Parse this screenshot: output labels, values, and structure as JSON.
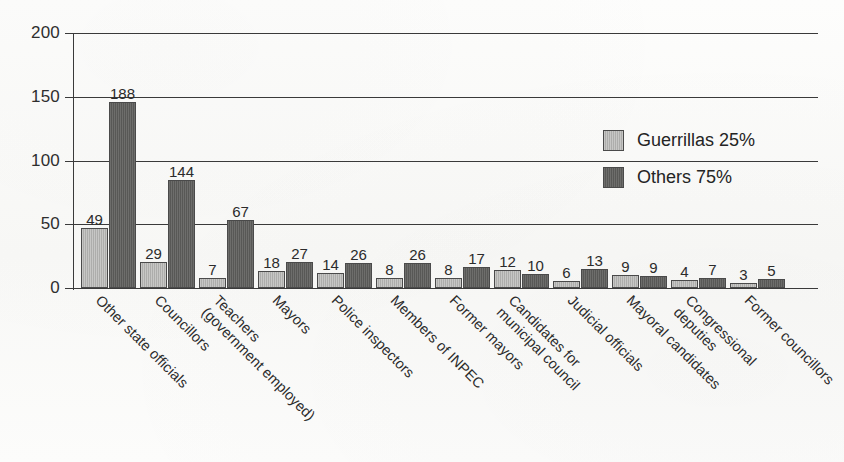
{
  "chart_data": {
    "type": "bar",
    "title": "",
    "subtitle": "",
    "xlabel": "",
    "ylabel": "",
    "ylim": [
      0,
      200
    ],
    "yticks": [
      0,
      50,
      100,
      150,
      200
    ],
    "ytick_labels": [
      "0",
      "50",
      "100",
      "150",
      "200"
    ],
    "grid": true,
    "grid_axis": "y",
    "legend_position": "inside-upper-right",
    "categories": [
      "Other state officials",
      "Councillors",
      "Teachers (government employed)",
      "Mayors",
      "Police inspectors",
      "Members of INPEC",
      "Former mayors",
      "Candidates for municipal council",
      "Judicial officials",
      "Mayoral candidates",
      "Congressional deputies",
      "Former councillors"
    ],
    "category_lines": [
      [
        "Other state officials"
      ],
      [
        "Councillors"
      ],
      [
        "Teachers",
        "(government employed)"
      ],
      [
        "Mayors"
      ],
      [
        "Police inspectors"
      ],
      [
        "Members of INPEC"
      ],
      [
        "Former mayors"
      ],
      [
        "Candidates for",
        "municipal council"
      ],
      [
        "Judicial officials"
      ],
      [
        "Mayoral candidates"
      ],
      [
        "Congressional",
        "deputies"
      ],
      [
        "Former councillors"
      ]
    ],
    "series": [
      {
        "name": "Guerrillas 25%",
        "color": "#b4b4b2",
        "values": [
          49,
          29,
          7,
          18,
          14,
          8,
          8,
          12,
          6,
          9,
          4,
          3
        ],
        "drawn_px": [
          60,
          26,
          10,
          17,
          15,
          10,
          10,
          18,
          7,
          13,
          8,
          5
        ]
      },
      {
        "name": "Others 75%",
        "color": "#5d5d5b",
        "values": [
          188,
          144,
          67,
          27,
          26,
          26,
          17,
          10,
          13,
          9,
          7,
          5
        ],
        "drawn_px": [
          186,
          108,
          68,
          26,
          25,
          25,
          21,
          14,
          19,
          12,
          10,
          9
        ]
      }
    ],
    "legend": [
      {
        "label": "Guerrillas 25%",
        "color": "#b4b4b2"
      },
      {
        "label": "Others 75%",
        "color": "#5d5d5b"
      }
    ],
    "colors": {
      "series_light": "#b4b4b2",
      "series_dark": "#5d5d5b",
      "axis": "#3a3a3a",
      "text": "#2b2b2b",
      "background": "#fbfbfa"
    }
  },
  "layout": {
    "plot": {
      "left": 73,
      "top": 33,
      "width": 745,
      "height": 255
    },
    "group_left": [
      8,
      67,
      126,
      185,
      244,
      303,
      362,
      421,
      480,
      539,
      598,
      657
    ],
    "bar_width": 27,
    "bar_gap": 1
  }
}
